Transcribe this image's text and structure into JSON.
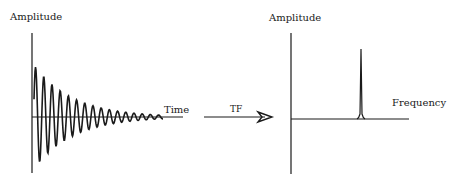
{
  "diagram": {
    "time_domain_panel": {
      "y_axis_label": "Amplitude",
      "x_axis_label": "Time",
      "signal": "exponentially decaying sinusoid"
    },
    "transform_arrow": {
      "label": "TF"
    },
    "frequency_domain_panel": {
      "y_axis_label": "Amplitude",
      "x_axis_label": "Frequency",
      "signal": "single sharp peak"
    },
    "colors": {
      "line": "#1a1a1a",
      "background": "#ffffff"
    }
  }
}
